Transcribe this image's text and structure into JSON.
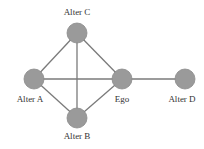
{
  "diagram": {
    "type": "ego-network",
    "colors": {
      "background": "#ffffff",
      "node_fill": "#9a9a9a",
      "node_stroke": "#8a8a8a",
      "edge": "#7a7a7a",
      "label": "#333333"
    },
    "nodes": [
      {
        "id": "alterC",
        "label": "Alter C",
        "cx": 77,
        "cy": 33,
        "r": 10,
        "lx": 77,
        "ly": 15
      },
      {
        "id": "alterA",
        "label": "Alter A",
        "cx": 34,
        "cy": 79,
        "r": 10,
        "lx": 30,
        "ly": 102
      },
      {
        "id": "ego",
        "label": "Ego",
        "cx": 122,
        "cy": 79,
        "r": 10,
        "lx": 122,
        "ly": 102
      },
      {
        "id": "alterD",
        "label": "Alter D",
        "cx": 185,
        "cy": 79,
        "r": 10,
        "lx": 182,
        "ly": 102
      },
      {
        "id": "alterB",
        "label": "Alter B",
        "cx": 77,
        "cy": 118,
        "r": 10,
        "lx": 77,
        "ly": 139
      }
    ],
    "edges": [
      {
        "from": "alterA",
        "to": "alterC"
      },
      {
        "from": "alterA",
        "to": "ego"
      },
      {
        "from": "alterA",
        "to": "alterB"
      },
      {
        "from": "alterC",
        "to": "ego"
      },
      {
        "from": "alterC",
        "to": "alterB"
      },
      {
        "from": "ego",
        "to": "alterB"
      },
      {
        "from": "ego",
        "to": "alterD"
      }
    ]
  }
}
